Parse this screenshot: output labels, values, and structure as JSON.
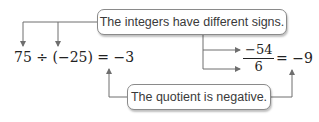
{
  "callouts": {
    "top": "The integers have different signs.",
    "bottom": "The quotient is negative."
  },
  "equation_left": {
    "text": "75 ÷ (−25) = −3"
  },
  "equation_right": {
    "numerator": "−54",
    "denominator": "6",
    "result": "= −9"
  },
  "colors": {
    "line": "#6e6e6e",
    "text": "#222222",
    "box_border": "#8a8a8a"
  }
}
